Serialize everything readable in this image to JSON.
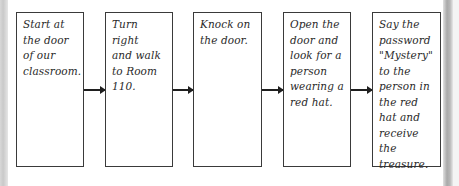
{
  "diagram": {
    "type": "flowchart",
    "direction": "left-to-right",
    "colors": {
      "box_border": "#3a3a3a",
      "arrow": "#1f1f1f",
      "text": "#2a2a2a",
      "background": "#ffffff"
    },
    "steps": [
      {
        "text": "Start at\nthe door\nof our\nclassroom."
      },
      {
        "text": "Turn right\nand walk\nto Room\n110."
      },
      {
        "text": "Knock on\nthe door."
      },
      {
        "text": "Open the\ndoor and\nlook for a\nperson\nwearing a\nred hat."
      },
      {
        "text": "Say the\npassword\n\"Mystery\"\nto the\nperson in\nthe red\nhat and\nreceive the\ntreasure."
      }
    ],
    "connectors": [
      {
        "from": 0,
        "to": 1,
        "icon": "arrow-right-icon"
      },
      {
        "from": 1,
        "to": 2,
        "icon": "arrow-right-icon"
      },
      {
        "from": 2,
        "to": 3,
        "icon": "arrow-right-icon"
      },
      {
        "from": 3,
        "to": 4,
        "icon": "arrow-right-icon"
      }
    ]
  }
}
